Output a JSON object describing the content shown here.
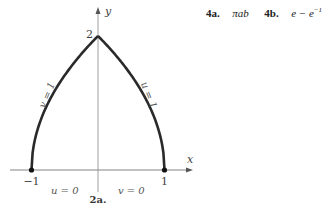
{
  "answers": [
    {
      "label": "4a.",
      "expr": "πab"
    },
    {
      "label": "4b.",
      "expr_base": "e − e",
      "expr_sup": "−1"
    }
  ],
  "chart_data": {
    "type": "line",
    "title": "2a.",
    "xlabel": "x",
    "ylabel": "y",
    "xlim": [
      -1.0,
      1.4
    ],
    "ylim": [
      0,
      2.4
    ],
    "grid": false,
    "legend": "none",
    "x_ticks": [
      {
        "value": -1,
        "label": "−1"
      },
      {
        "value": 1,
        "label": "1"
      }
    ],
    "y_ticks": [
      {
        "value": 2,
        "label": "2"
      }
    ],
    "series": [
      {
        "name": "v = 1",
        "points": [
          [
            -1,
            0
          ],
          [
            -0.9,
            0.63
          ],
          [
            -0.75,
            1.0
          ],
          [
            -0.5,
            1.41
          ],
          [
            -0.25,
            1.73
          ],
          [
            0,
            2
          ]
        ]
      },
      {
        "name": "u = 1",
        "points": [
          [
            0,
            2
          ],
          [
            0.25,
            1.73
          ],
          [
            0.5,
            1.41
          ],
          [
            0.75,
            1.0
          ],
          [
            0.9,
            0.63
          ],
          [
            1,
            0
          ]
        ]
      }
    ],
    "points": [
      [
        -1,
        0
      ],
      [
        1,
        0
      ],
      [
        0,
        2
      ]
    ],
    "annotations": [
      {
        "text": "v = 1",
        "x": -0.72,
        "y": 1.1,
        "rotate": true
      },
      {
        "text": "u = 1",
        "x": 0.72,
        "y": 1.1,
        "rotate": true
      },
      {
        "text": "u = 0",
        "x": -0.5,
        "y": -0.2
      },
      {
        "text": "v = 0",
        "x": 0.5,
        "y": -0.2
      }
    ]
  }
}
